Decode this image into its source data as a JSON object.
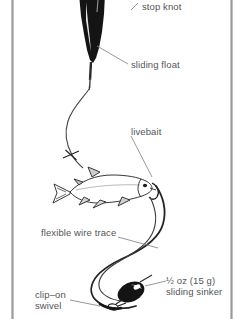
{
  "figure": {
    "background_color": "#ffffff",
    "border_rule_color": "#9a9a9c",
    "ink_color": "#1a1a1a",
    "label_color": "#555557",
    "leader_line_color": "#8c8c8e"
  },
  "labels": {
    "stop_knot": "stop knot",
    "sliding_float": "sliding float",
    "livebait": "livebait",
    "flexible_wire_trace": "flexible wire trace",
    "sliding_sinker_weight": "½  oz (15 g)",
    "sliding_sinker": "sliding sinker",
    "clip_on": "clip–on",
    "swivel": "swivel"
  },
  "components": [
    {
      "name": "stop-knot",
      "label": "stop knot"
    },
    {
      "name": "sliding-float",
      "label": "sliding float"
    },
    {
      "name": "livebait",
      "label": "livebait"
    },
    {
      "name": "flexible-wire-trace",
      "label": "flexible wire trace"
    },
    {
      "name": "sliding-sinker",
      "label": "½  oz (15 g) sliding sinker"
    },
    {
      "name": "clip-on-swivel",
      "label": "clip–on swivel"
    }
  ]
}
